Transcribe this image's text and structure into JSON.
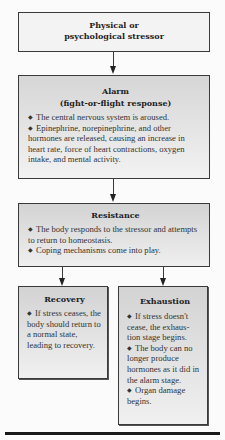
{
  "diagram": {
    "type": "flowchart",
    "nodes": {
      "stressor": {
        "title_line1": "Physical or",
        "title_line2": "psychological stressor"
      },
      "alarm": {
        "title": "Alarm",
        "subtitle": "(fight-or-flight response)",
        "bullets": [
          "The central nervous system is aroused.",
          "Epinephrine, norepinephrine, and other hormones are released, causing an increase in heart rate, force of heart contractions, oxygen intake, and mental activity."
        ]
      },
      "resistance": {
        "title": "Resistance",
        "bullets": [
          "The body responds to the stressor and attempts to return to homeostasis.",
          "Coping mechanisms come into play."
        ]
      },
      "recovery": {
        "title": "Recovery",
        "bullets": [
          "If stress ceases, the body should return to a normal state, leading to recovery."
        ]
      },
      "exhaustion": {
        "title": "Exhaustion",
        "bullets": [
          "If stress doesn't cease, the exhaus- tion stage begins.",
          "The body can no longer produce hormones as it did in the alarm stage.",
          "Organ damage begins."
        ]
      }
    },
    "edges": [
      {
        "from": "stressor",
        "to": "alarm"
      },
      {
        "from": "alarm",
        "to": "resistance"
      },
      {
        "from": "resistance",
        "to": "recovery"
      },
      {
        "from": "resistance",
        "to": "exhaustion"
      }
    ],
    "bullet_glyph": "◆",
    "colors": {
      "border": "#3a3a3a",
      "box_fill_top": "#d4d4d4",
      "box_fill_bottom": "#f1f1f1",
      "stressor_fill": "#f3f3f3",
      "background": "#fbfbfb"
    }
  }
}
